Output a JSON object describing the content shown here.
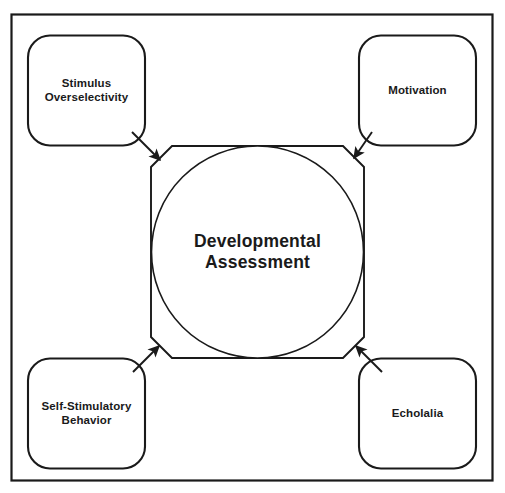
{
  "diagram": {
    "title": "Developmental Assessment",
    "frame": {
      "stroke": "#1a1a1a",
      "fill": "#ffffff"
    },
    "center": {
      "label": "Developmental\nAssessment",
      "shape": "octagon-with-inscribed-circle",
      "stroke": "#1a1a1a",
      "fill": "#ffffff"
    },
    "nodes": [
      {
        "id": "stimulus-overselectivity",
        "label": "Stimulus\nOverselectivity",
        "position": "top-left",
        "shape": "rounded-rectangle",
        "stroke": "#1a1a1a",
        "fill": "#ffffff"
      },
      {
        "id": "motivation",
        "label": "Motivation",
        "position": "top-right",
        "shape": "rounded-rectangle",
        "stroke": "#1a1a1a",
        "fill": "#ffffff"
      },
      {
        "id": "self-stimulatory-behavior",
        "label": "Self-Stimulatory\nBehavior",
        "position": "bottom-left",
        "shape": "rounded-rectangle",
        "stroke": "#1a1a1a",
        "fill": "#ffffff"
      },
      {
        "id": "echolalia",
        "label": "Echolalia",
        "position": "bottom-right",
        "shape": "rounded-rectangle",
        "stroke": "#1a1a1a",
        "fill": "#ffffff"
      }
    ],
    "connectors": [
      {
        "id": "arrow-stimulus-to-center",
        "from": "stimulus-overselectivity",
        "to": "center",
        "direction": "down-right",
        "arrowhead": "filled-triangle"
      },
      {
        "id": "arrow-motivation-to-center",
        "from": "motivation",
        "to": "center",
        "direction": "down-left",
        "arrowhead": "filled-triangle"
      },
      {
        "id": "arrow-self-stimulatory-to-center",
        "from": "self-stimulatory-behavior",
        "to": "center",
        "direction": "up-right",
        "arrowhead": "filled-triangle"
      },
      {
        "id": "arrow-echolalia-to-center",
        "from": "echolalia",
        "to": "center",
        "direction": "up-left",
        "arrowhead": "filled-triangle"
      }
    ]
  }
}
